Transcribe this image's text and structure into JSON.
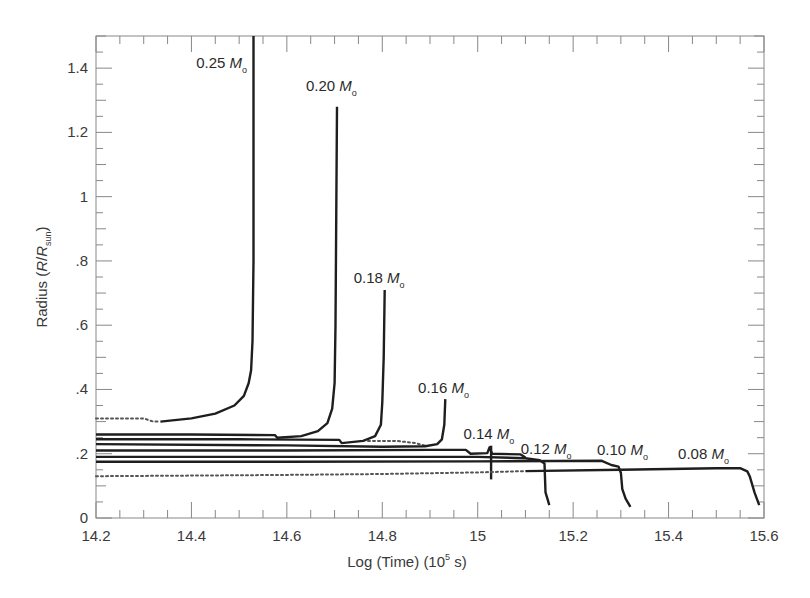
{
  "chart_data": {
    "type": "line",
    "title": "",
    "xlabel": "Log (Time) (10^5 s)",
    "xlabel_parts": {
      "pre": "Log (Time) (10",
      "sup": "5",
      "post": " s)"
    },
    "ylabel": "Radius (R/R_sun)",
    "ylabel_parts": {
      "pre": "Radius (",
      "italic1": "R",
      "slash": "/",
      "italic2": "R",
      "sub": "sun",
      "post": ")"
    },
    "xlim": [
      14.2,
      15.6
    ],
    "ylim": [
      0,
      1.5
    ],
    "grid": false,
    "legend": "none (inline annotations)",
    "x_ticks": [
      14.2,
      14.4,
      14.6,
      14.8,
      15,
      15.2,
      15.4,
      15.6
    ],
    "x_tick_labels": [
      "14.2",
      "14.4",
      "14.6",
      "14.8",
      "15",
      "15.2",
      "15.4",
      "15.6"
    ],
    "x_minor_step": 0.05,
    "y_ticks": [
      0,
      0.2,
      0.4,
      0.6,
      0.8,
      1.0,
      1.2,
      1.4
    ],
    "y_tick_labels": [
      "0",
      ".2",
      ".4",
      ".6",
      ".8",
      "1",
      "1.2",
      "1.4"
    ],
    "y_minor_step": 0.1,
    "series": [
      {
        "name": "0.25 Mo",
        "label": "0.25",
        "label_pos": [
          14.41,
          1.4
        ],
        "dotted": [
          [
            14.2,
            0.31
          ],
          [
            14.3,
            0.31
          ],
          [
            14.32,
            0.3
          ],
          [
            14.335,
            0.3
          ]
        ],
        "points": [
          [
            14.335,
            0.3
          ],
          [
            14.4,
            0.31
          ],
          [
            14.45,
            0.325
          ],
          [
            14.49,
            0.35
          ],
          [
            14.51,
            0.38
          ],
          [
            14.52,
            0.42
          ],
          [
            14.525,
            0.46
          ],
          [
            14.528,
            0.55
          ],
          [
            14.53,
            0.8
          ],
          [
            14.53,
            1.5
          ]
        ]
      },
      {
        "name": "0.20 Mo",
        "label": "0.20",
        "label_pos": [
          14.64,
          1.33
        ],
        "points": [
          [
            14.2,
            0.26
          ],
          [
            14.4,
            0.26
          ],
          [
            14.575,
            0.258
          ],
          [
            14.58,
            0.25
          ],
          [
            14.63,
            0.255
          ],
          [
            14.665,
            0.27
          ],
          [
            14.685,
            0.295
          ],
          [
            14.695,
            0.34
          ],
          [
            14.7,
            0.42
          ],
          [
            14.702,
            0.6
          ],
          [
            14.705,
            1.28
          ]
        ]
      },
      {
        "name": "0.18 Mo",
        "label": "0.18",
        "label_pos": [
          14.74,
          0.73
        ],
        "points": [
          [
            14.2,
            0.245
          ],
          [
            14.5,
            0.245
          ],
          [
            14.71,
            0.243
          ],
          [
            14.715,
            0.233
          ],
          [
            14.76,
            0.24
          ],
          [
            14.785,
            0.255
          ],
          [
            14.797,
            0.29
          ],
          [
            14.8,
            0.36
          ],
          [
            14.803,
            0.5
          ],
          [
            14.805,
            0.71
          ]
        ]
      },
      {
        "name": "0.16 Mo",
        "label": "0.16",
        "label_pos": [
          14.875,
          0.39
        ],
        "dotted": [
          [
            14.77,
            0.24
          ],
          [
            14.83,
            0.24
          ],
          [
            14.87,
            0.233
          ],
          [
            14.89,
            0.225
          ]
        ],
        "points": [
          [
            14.2,
            0.23
          ],
          [
            14.6,
            0.226
          ],
          [
            14.8,
            0.222
          ],
          [
            14.89,
            0.223
          ],
          [
            14.915,
            0.23
          ],
          [
            14.925,
            0.245
          ],
          [
            14.93,
            0.29
          ],
          [
            14.932,
            0.37
          ]
        ]
      },
      {
        "name": "0.14 Mo",
        "label": "0.14",
        "label_pos": [
          14.97,
          0.245
        ],
        "points": [
          [
            14.2,
            0.21
          ],
          [
            14.6,
            0.21
          ],
          [
            14.9,
            0.212
          ],
          [
            14.975,
            0.212
          ],
          [
            14.985,
            0.2
          ],
          [
            15.02,
            0.202
          ],
          [
            15.025,
            0.22
          ],
          [
            15.03,
            0.2
          ],
          [
            15.09,
            0.198
          ],
          [
            15.1,
            0.188
          ]
        ],
        "spike": [
          [
            15.028,
            0.12
          ],
          [
            15.028,
            0.225
          ]
        ]
      },
      {
        "name": "0.12 Mo",
        "label": "0.12",
        "label_pos": [
          15.09,
          0.2
        ],
        "points": [
          [
            14.2,
            0.19
          ],
          [
            14.6,
            0.19
          ],
          [
            15.0,
            0.19
          ],
          [
            15.1,
            0.186
          ],
          [
            15.13,
            0.18
          ],
          [
            15.14,
            0.17
          ],
          [
            15.142,
            0.08
          ],
          [
            15.146,
            0.06
          ],
          [
            15.15,
            0.04
          ]
        ]
      },
      {
        "name": "0.10 Mo",
        "label": "0.10",
        "label_pos": [
          15.25,
          0.195
        ],
        "points": [
          [
            14.2,
            0.175
          ],
          [
            14.6,
            0.175
          ],
          [
            15.0,
            0.176
          ],
          [
            15.26,
            0.178
          ],
          [
            15.28,
            0.165
          ],
          [
            15.295,
            0.16
          ],
          [
            15.3,
            0.14
          ],
          [
            15.303,
            0.09
          ],
          [
            15.31,
            0.06
          ],
          [
            15.32,
            0.035
          ]
        ]
      },
      {
        "name": "0.08 Mo",
        "label": "0.08",
        "label_pos": [
          15.42,
          0.185
        ],
        "dotted": [
          [
            14.2,
            0.13
          ],
          [
            14.4,
            0.132
          ],
          [
            14.6,
            0.134
          ],
          [
            14.8,
            0.137
          ],
          [
            15.0,
            0.142
          ],
          [
            15.1,
            0.146
          ]
        ],
        "points": [
          [
            15.1,
            0.146
          ],
          [
            15.3,
            0.15
          ],
          [
            15.5,
            0.155
          ],
          [
            15.55,
            0.155
          ],
          [
            15.565,
            0.145
          ],
          [
            15.57,
            0.13
          ],
          [
            15.58,
            0.08
          ],
          [
            15.59,
            0.04
          ]
        ]
      }
    ],
    "annotations": [
      "0.25 Mo",
      "0.20 Mo",
      "0.18 Mo",
      "0.16 Mo",
      "0.14 Mo",
      "0.12 Mo",
      "0.10 Mo",
      "0.08 Mo"
    ],
    "mass_unit_symbol": "M",
    "mass_unit_subscript": "o",
    "colors": {
      "line": "#1e1e1e",
      "dotted": "#555555",
      "frame": "#888888",
      "text": "#3a3a3a"
    }
  },
  "plot_frame": {
    "left": 96,
    "top": 36,
    "right": 764,
    "bottom": 518
  }
}
